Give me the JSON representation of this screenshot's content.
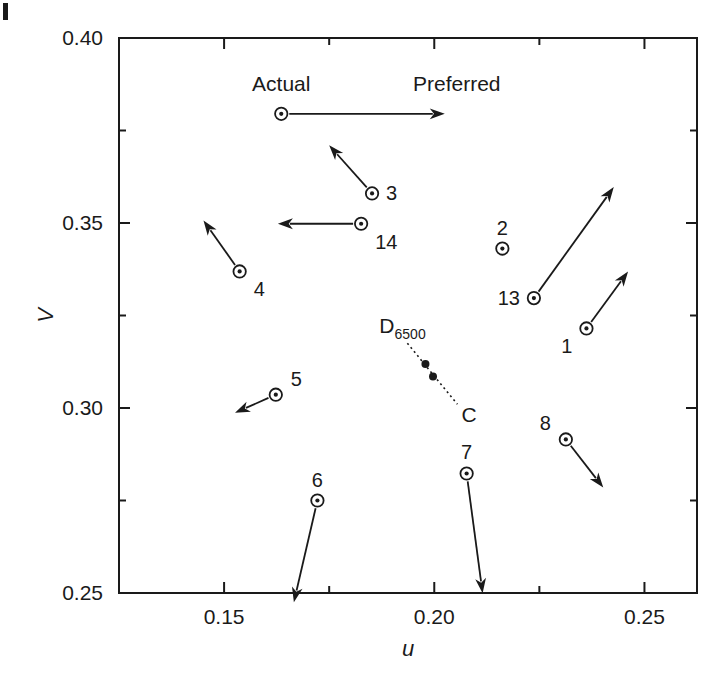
{
  "chart_data": {
    "type": "scatter",
    "title": "",
    "xlabel": "u",
    "ylabel": "V",
    "xlim": [
      0.125,
      0.2625
    ],
    "ylim": [
      0.25,
      0.4
    ],
    "xticks": [
      "0.15",
      "0.20",
      "0.25"
    ],
    "xtick_values": [
      0.15,
      0.2,
      0.25
    ],
    "xminor_values": [
      0.175,
      0.225
    ],
    "yticks": [
      "0.40",
      "0.35",
      "0.30",
      "0.25"
    ],
    "ytick_values": [
      0.4,
      0.35,
      0.3,
      0.25
    ],
    "yminor_values": [
      0.375,
      0.325,
      0.275
    ],
    "grid": false,
    "legend_position": "in-plot-top",
    "marker_style": "open-circle-with-center-dot",
    "annotations": {
      "actual_label": "Actual",
      "preferred_label": "Preferred",
      "legend_point": {
        "u": 0.1636,
        "v": 0.3795
      },
      "legend_arrow_to": {
        "u": 0.2025,
        "v": 0.3795
      }
    },
    "illuminants": {
      "d65_label": "D",
      "d65_subscript": "6500",
      "c_label": "C",
      "points": [
        {
          "name": "D6500",
          "u": 0.1979,
          "v": 0.3119
        },
        {
          "name": "C",
          "u": 0.1997,
          "v": 0.3085
        }
      ],
      "connector": {
        "from_u": 0.1936,
        "to_u": 0.2055,
        "from_v": 0.3175,
        "to_v": 0.301
      }
    },
    "points": [
      {
        "id": "1",
        "label": "1",
        "u": 0.2362,
        "v": 0.3215,
        "label_pos": "below-left",
        "arrow_to_u": 0.2461,
        "arrow_to_v": 0.3369,
        "has_arrow": true
      },
      {
        "id": "2",
        "label": "2",
        "u": 0.2162,
        "v": 0.3431,
        "label_pos": "above",
        "arrow_to_u": null,
        "arrow_to_v": null,
        "has_arrow": false
      },
      {
        "id": "3",
        "label": "3",
        "u": 0.1852,
        "v": 0.358,
        "label_pos": "right",
        "arrow_to_u": 0.175,
        "arrow_to_v": 0.371,
        "has_arrow": true
      },
      {
        "id": "4",
        "label": "4",
        "u": 0.1537,
        "v": 0.3369,
        "label_pos": "below-right",
        "arrow_to_u": 0.1451,
        "arrow_to_v": 0.3507,
        "has_arrow": true
      },
      {
        "id": "5",
        "label": "5",
        "u": 0.1623,
        "v": 0.3036,
        "label_pos": "above-right",
        "arrow_to_u": 0.1526,
        "arrow_to_v": 0.2987,
        "has_arrow": true
      },
      {
        "id": "6",
        "label": "6",
        "u": 0.1722,
        "v": 0.275,
        "label_pos": "above",
        "arrow_to_u": 0.1666,
        "arrow_to_v": 0.2475,
        "has_arrow": true
      },
      {
        "id": "7",
        "label": "7",
        "u": 0.2077,
        "v": 0.2823,
        "label_pos": "above",
        "arrow_to_u": 0.2115,
        "arrow_to_v": 0.2499,
        "has_arrow": true
      },
      {
        "id": "8",
        "label": "8",
        "u": 0.2313,
        "v": 0.2915,
        "label_pos": "above-left",
        "arrow_to_u": 0.2402,
        "arrow_to_v": 0.2785,
        "has_arrow": true
      },
      {
        "id": "13",
        "label": "13",
        "u": 0.2237,
        "v": 0.3297,
        "label_pos": "left",
        "arrow_to_u": 0.2427,
        "arrow_to_v": 0.3597,
        "has_arrow": true
      },
      {
        "id": "14",
        "label": "14",
        "u": 0.1826,
        "v": 0.3498,
        "label_pos": "below-right",
        "arrow_to_u": 0.1628,
        "arrow_to_v": 0.3498,
        "has_arrow": true
      }
    ]
  }
}
